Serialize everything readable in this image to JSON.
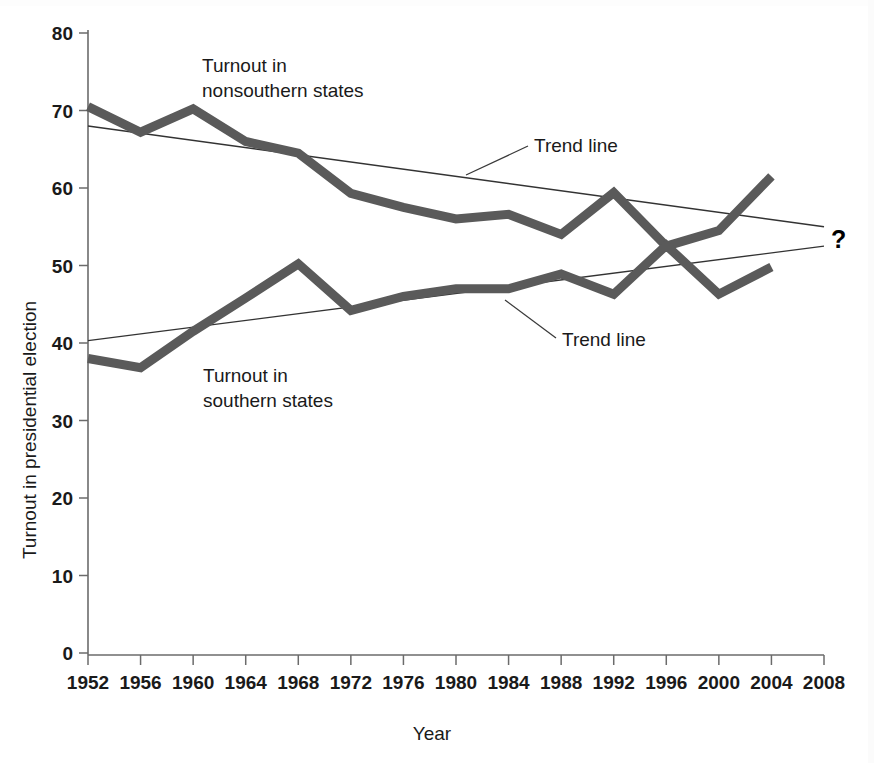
{
  "chart_data": {
    "type": "line",
    "title": "",
    "xlabel": "Year",
    "ylabel": "Turnout in presidential election",
    "xlim": [
      1952,
      2008
    ],
    "ylim": [
      0,
      80
    ],
    "grid": false,
    "legend_position": "inline-annotations",
    "categories": [
      1952,
      1956,
      1960,
      1964,
      1968,
      1972,
      1976,
      1980,
      1984,
      1988,
      1992,
      1996,
      2000,
      2004
    ],
    "x_tick_labels": [
      "1952",
      "1956",
      "1960",
      "1964",
      "1968",
      "1972",
      "1976",
      "1980",
      "1984",
      "1988",
      "1992",
      "1996",
      "2000",
      "2004",
      "2008"
    ],
    "y_tick_labels": [
      "0",
      "10",
      "20",
      "30",
      "40",
      "50",
      "60",
      "70",
      "80"
    ],
    "y_ticks": [
      0,
      10,
      20,
      30,
      40,
      50,
      60,
      70,
      80
    ],
    "series": [
      {
        "name": "Turnout in nonsouthern states",
        "color": "#5a5a5a",
        "values": [
          70.5,
          67.2,
          70.2,
          66.0,
          64.5,
          59.3,
          57.5,
          56.0,
          56.6,
          54.0,
          59.4,
          52.5,
          54.5,
          61.5
        ]
      },
      {
        "name": "Turnout in southern states",
        "color": "#5a5a5a",
        "values": [
          38.0,
          36.8,
          41.5,
          45.8,
          50.2,
          44.2,
          46.0,
          47.0,
          47.0,
          48.9,
          46.3,
          52.6,
          46.3,
          49.8
        ]
      }
    ],
    "trend_lines": [
      {
        "name": "Trend line (nonsouthern)",
        "x_start": 1952,
        "y_start": 68.0,
        "x_end": 2008,
        "y_end": 55.0,
        "color": "#333333"
      },
      {
        "name": "Trend line (southern)",
        "x_start": 1952,
        "y_start": 40.3,
        "x_end": 2008,
        "y_end": 52.5,
        "color": "#333333"
      }
    ],
    "annotations": [
      {
        "name": "nonsouthern-series-label",
        "text_line1": "Turnout in",
        "text_line2": "nonsouthern states",
        "x": 202,
        "y": 72
      },
      {
        "name": "trend-line-label-upper",
        "text": "Trend line",
        "x": 534,
        "y": 152
      },
      {
        "name": "trend-line-label-lower",
        "text": "Trend line",
        "x": 560,
        "y": 344
      },
      {
        "name": "southern-series-label",
        "text_line1": "Turnout in",
        "text_line2": "southern states",
        "x": 203,
        "y": 374
      },
      {
        "name": "question-mark",
        "text": "?",
        "x": 833,
        "y": 246
      }
    ]
  },
  "labels": {
    "ylabel": "Turnout in presidential election",
    "xlabel": "Year",
    "nonsouthern_l1": "Turnout in",
    "nonsouthern_l2": "nonsouthern states",
    "southern_l1": "Turnout in",
    "southern_l2": "southern states",
    "trend_upper": "Trend line",
    "trend_lower": "Trend line",
    "question": "?"
  },
  "ticks": {
    "x": [
      "1952",
      "1956",
      "1960",
      "1964",
      "1968",
      "1972",
      "1976",
      "1980",
      "1984",
      "1988",
      "1992",
      "1996",
      "2000",
      "2004",
      "2008"
    ],
    "y": [
      "80",
      "70",
      "60",
      "50",
      "40",
      "30",
      "20",
      "10",
      "0"
    ]
  },
  "colors": {
    "series_line": "#5a5a5a",
    "trend_line": "#333333",
    "axis": "#6b6b6b",
    "text": "#1a1a1a",
    "background": "#ffffff"
  }
}
